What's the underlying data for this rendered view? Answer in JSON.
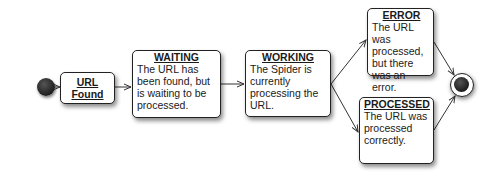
{
  "diagram": {
    "type": "state-machine",
    "start": {
      "label": ""
    },
    "end": {
      "label": ""
    },
    "states": [
      {
        "id": "url_found",
        "title": "URL Found",
        "description": ""
      },
      {
        "id": "waiting",
        "title": "WAITING",
        "description": "The URL has been found, but is waiting to be processed."
      },
      {
        "id": "working",
        "title": "WORKING",
        "description": "The Spider is currently processing the URL."
      },
      {
        "id": "error",
        "title": "ERROR",
        "description": "The URL was processed, but there was an error."
      },
      {
        "id": "processed",
        "title": "PROCESSED",
        "description": "The URL was processed correctly."
      }
    ],
    "transitions": [
      {
        "from": "start",
        "to": "url_found"
      },
      {
        "from": "url_found",
        "to": "waiting"
      },
      {
        "from": "waiting",
        "to": "working"
      },
      {
        "from": "working",
        "to": "error"
      },
      {
        "from": "working",
        "to": "processed"
      },
      {
        "from": "error",
        "to": "end"
      },
      {
        "from": "processed",
        "to": "end"
      }
    ],
    "url_found_lines": [
      "URL",
      "Found"
    ],
    "colors": {
      "stroke": "#222222",
      "fill": "#ffffff",
      "node": "#1d1d1d"
    }
  }
}
